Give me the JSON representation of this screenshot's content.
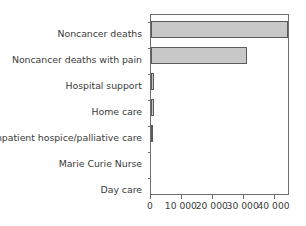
{
  "chart_data": {
    "type": "bar",
    "orientation": "horizontal",
    "title": "",
    "subtitle": "",
    "xlabel": "",
    "ylabel": "",
    "categories": [
      "Noncancer deaths",
      "Noncancer deaths with pain",
      "Hospital support",
      "Home care",
      "Inpatient hospice/palliative care",
      "Marie Curie Nurse",
      "Day care"
    ],
    "values": [
      44500,
      31000,
      1100,
      900,
      500,
      0,
      0
    ],
    "xlim": [
      0,
      45000
    ],
    "ylim": [
      0,
      7
    ],
    "xticks": [
      0,
      10000,
      20000,
      30000,
      40000
    ],
    "xticklabels": [
      "0",
      "10 000",
      "20 000",
      "30 000",
      "40 000"
    ],
    "grid": false,
    "legend": null,
    "legend_position": "none",
    "annotations": []
  },
  "style": {
    "bar_fill": "#c8c8c8",
    "bar_edge": "#5a5a5a",
    "axis_color": "#6e6e6e",
    "text_color": "#3b3b3b",
    "background": "#ffffff"
  }
}
